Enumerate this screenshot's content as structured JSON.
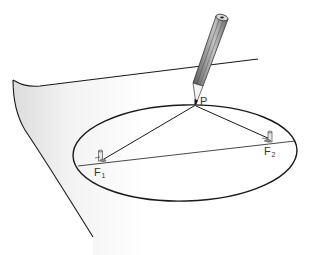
{
  "diagram": {
    "labels": {
      "point": "P",
      "focus1_letter": "F",
      "focus1_sub": "1",
      "focus2_letter": "F",
      "focus2_sub": "2"
    },
    "elements": [
      "paper-sheet",
      "ellipse",
      "major-axis",
      "string-to-F1",
      "string-to-F2",
      "pin-F1",
      "pin-F2",
      "pencil"
    ],
    "colors": {
      "line": "#1a1a1a",
      "paper_shadow": "#e6e6e6",
      "pencil_body": "#8a8a8a",
      "pencil_dark": "#555555",
      "pencil_light": "#c8c8c8",
      "label": "#333333"
    }
  }
}
